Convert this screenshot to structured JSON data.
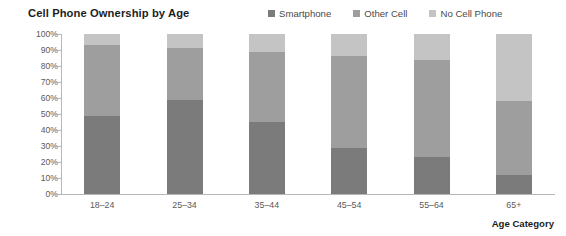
{
  "chart_data": {
    "type": "bar",
    "subtype": "stacked-100-percent",
    "title": "Cell Phone Ownership by Age",
    "xlabel": "Age Category",
    "ylabel": "",
    "categories": [
      "18–24",
      "25–34",
      "35–44",
      "45–54",
      "55–64",
      "65+"
    ],
    "series": [
      {
        "name": "Smartphone",
        "color": "#7b7b7b",
        "values": [
          49,
          59,
          45,
          29,
          23,
          12
        ]
      },
      {
        "name": "Other Cell",
        "color": "#9e9e9e",
        "values": [
          44,
          32,
          44,
          57,
          61,
          46
        ]
      },
      {
        "name": "No Cell Phone",
        "color": "#c4c4c4",
        "values": [
          7,
          9,
          11,
          14,
          16,
          42
        ]
      }
    ],
    "ylim": [
      0,
      100
    ],
    "yticks": [
      0,
      10,
      20,
      30,
      40,
      50,
      60,
      70,
      80,
      90,
      100
    ],
    "ytick_labels": [
      "0%",
      "10%",
      "20%",
      "30%",
      "40%",
      "50%",
      "60%",
      "70%",
      "80%",
      "90%",
      "100%"
    ],
    "grid": false,
    "legend_position": "top-right"
  },
  "legend": {
    "items": [
      {
        "label": "Smartphone",
        "color": "#7b7b7b"
      },
      {
        "label": "Other Cell",
        "color": "#9e9e9e"
      },
      {
        "label": "No Cell Phone",
        "color": "#c4c4c4"
      }
    ]
  }
}
